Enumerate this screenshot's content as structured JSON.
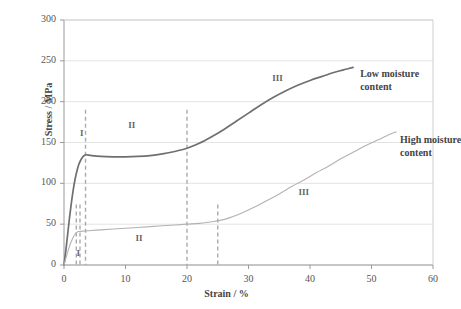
{
  "chart_data": {
    "type": "line",
    "title": "",
    "xlabel": "Strain / %",
    "ylabel": "Stress / MPa",
    "xlim": [
      0,
      60
    ],
    "ylim": [
      0,
      300
    ],
    "xticks": [
      0,
      10,
      20,
      30,
      40,
      50,
      60
    ],
    "yticks": [
      0,
      50,
      100,
      150,
      200,
      250,
      300
    ],
    "grid": "horizontal",
    "legend_position": "inline-annotation",
    "series": [
      {
        "name": "Low moisture content",
        "color": "#6f6f6f",
        "points": [
          [
            0,
            0
          ],
          [
            0.3,
            18
          ],
          [
            0.6,
            38
          ],
          [
            0.9,
            58
          ],
          [
            1.2,
            76
          ],
          [
            1.5,
            92
          ],
          [
            1.8,
            105
          ],
          [
            2.1,
            115
          ],
          [
            2.4,
            123
          ],
          [
            2.7,
            128
          ],
          [
            3.0,
            132
          ],
          [
            3.3,
            134
          ],
          [
            3.6,
            135
          ],
          [
            4.5,
            134
          ],
          [
            6,
            133
          ],
          [
            8,
            132.5
          ],
          [
            10,
            132.5
          ],
          [
            12,
            133
          ],
          [
            14,
            134
          ],
          [
            16,
            136
          ],
          [
            18,
            139
          ],
          [
            20,
            143
          ],
          [
            22,
            149
          ],
          [
            24,
            157
          ],
          [
            26,
            166
          ],
          [
            28,
            176
          ],
          [
            30,
            186
          ],
          [
            32,
            196
          ],
          [
            34,
            205
          ],
          [
            36,
            213
          ],
          [
            38,
            220
          ],
          [
            40,
            226
          ],
          [
            42,
            231
          ],
          [
            44,
            236
          ],
          [
            46,
            240
          ],
          [
            47,
            242
          ]
        ]
      },
      {
        "name": "High moisture content",
        "color": "#b3b3b3",
        "points": [
          [
            0,
            0
          ],
          [
            0.3,
            8
          ],
          [
            0.6,
            16
          ],
          [
            0.9,
            23
          ],
          [
            1.2,
            29
          ],
          [
            1.5,
            34
          ],
          [
            1.8,
            38
          ],
          [
            2.1,
            40
          ],
          [
            2.3,
            41
          ],
          [
            2.6,
            41
          ],
          [
            3.0,
            41.5
          ],
          [
            4,
            42
          ],
          [
            6,
            43
          ],
          [
            8,
            44
          ],
          [
            10,
            45
          ],
          [
            12,
            46
          ],
          [
            14,
            47
          ],
          [
            16,
            48
          ],
          [
            18,
            49
          ],
          [
            20,
            50
          ],
          [
            22,
            51
          ],
          [
            24,
            53
          ],
          [
            25,
            54
          ],
          [
            27,
            58
          ],
          [
            29,
            64
          ],
          [
            31,
            71
          ],
          [
            33,
            79
          ],
          [
            35,
            87
          ],
          [
            37,
            96
          ],
          [
            39,
            104
          ],
          [
            41,
            113
          ],
          [
            43,
            121
          ],
          [
            45,
            130
          ],
          [
            47,
            138
          ],
          [
            49,
            146
          ],
          [
            51,
            153
          ],
          [
            53,
            160
          ],
          [
            54,
            163
          ]
        ]
      }
    ],
    "dividers": [
      {
        "x": 2.0,
        "y_from": 0,
        "y_to": 74,
        "style": "dashed",
        "color": "#aaaaaa"
      },
      {
        "x": 2.6,
        "y_from": 0,
        "y_to": 74,
        "style": "dashed",
        "color": "#aaaaaa"
      },
      {
        "x": 3.5,
        "y_from": 0,
        "y_to": 190,
        "style": "dashed",
        "color": "#aaaaaa"
      },
      {
        "x": 20.0,
        "y_from": 0,
        "y_to": 190,
        "style": "dashed",
        "color": "#aaaaaa"
      },
      {
        "x": 25.0,
        "y_from": 0,
        "y_to": 74,
        "style": "dashed",
        "color": "#aaaaaa"
      }
    ],
    "region_labels": [
      {
        "text": "I",
        "x": 2.9,
        "y": 160,
        "for": "low"
      },
      {
        "text": "II",
        "x": 11.0,
        "y": 170,
        "for": "low"
      },
      {
        "text": "III",
        "x": 34.7,
        "y": 228,
        "for": "low"
      },
      {
        "text": "I",
        "x": 2.3,
        "y": 14,
        "for": "high"
      },
      {
        "text": "II",
        "x": 12.2,
        "y": 32,
        "for": "high"
      },
      {
        "text": "III",
        "x": 39.0,
        "y": 88,
        "for": "high"
      }
    ],
    "annotations": [
      {
        "lines": [
          "Low moisture",
          "content"
        ],
        "x": 47.5,
        "y": 233
      },
      {
        "lines": [
          "High moisture",
          "content"
        ],
        "x": 54.0,
        "y": 152
      }
    ]
  }
}
